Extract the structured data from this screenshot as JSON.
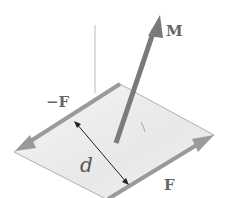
{
  "diagram": {
    "labels": {
      "moment": "M",
      "force_negative": "−F",
      "force_positive": "F",
      "distance": "d"
    },
    "colors": {
      "plane_fill": "#eeeeee",
      "plane_edge": "#a0a0a0",
      "force_arrow": "#9a9a9a",
      "moment_arrow": "#7a7a7a",
      "distance_arrow": "#222222",
      "axis_line": "#c8c8c8",
      "label": "#666666"
    }
  }
}
